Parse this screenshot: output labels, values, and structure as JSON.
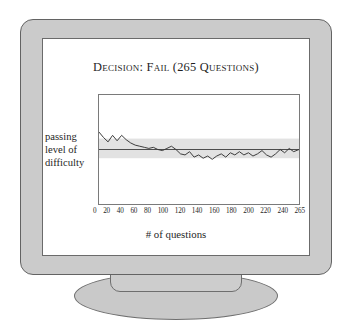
{
  "illustration": {
    "device": "crt-monitor",
    "bezel_color": "#cbcbcb",
    "screen_color": "#ffffff",
    "outline_color": "#636363"
  },
  "slide": {
    "title": "Decision: Fail (265 Questions)",
    "y_axis_label_lines": [
      "passing",
      "level of",
      "difficulty"
    ],
    "x_axis_caption": "# of questions"
  },
  "chart_data": {
    "type": "line",
    "title": "Decision: Fail (265 Questions)",
    "xlabel": "# of questions",
    "ylabel": "passing level of difficulty",
    "xlim": [
      0,
      265
    ],
    "ylim": [
      0,
      100
    ],
    "grid": false,
    "legend": "none",
    "tick_labels": [
      "0",
      "20",
      "40",
      "60",
      "80",
      "100",
      "120",
      "140",
      "160",
      "180",
      "200",
      "220",
      "240",
      "265"
    ],
    "ticks": [
      0,
      20,
      40,
      60,
      80,
      100,
      120,
      140,
      160,
      180,
      200,
      220,
      240,
      265
    ],
    "annotations": {
      "passing_line_value": 50,
      "confidence_band": [
        42,
        60
      ],
      "band_color": "#e2e2e2",
      "line_color": "#3a3a3a",
      "passing_line_color": "#4a4a4a"
    },
    "series": [
      {
        "name": "ability estimate",
        "x": [
          0,
          6,
          12,
          18,
          24,
          30,
          36,
          42,
          48,
          54,
          60,
          66,
          72,
          78,
          84,
          90,
          96,
          102,
          108,
          114,
          120,
          126,
          132,
          138,
          144,
          150,
          156,
          162,
          168,
          174,
          180,
          186,
          192,
          198,
          204,
          210,
          216,
          222,
          228,
          234,
          240,
          246,
          252,
          258,
          265
        ],
        "values": [
          66,
          61,
          57,
          63,
          58,
          63,
          59,
          56,
          54,
          53,
          52,
          51,
          52,
          50,
          49,
          51,
          53,
          50,
          46,
          45,
          48,
          43,
          45,
          42,
          44,
          41,
          44,
          46,
          43,
          47,
          45,
          48,
          45,
          47,
          44,
          46,
          49,
          45,
          43,
          46,
          50,
          47,
          51,
          48,
          50
        ]
      }
    ]
  }
}
